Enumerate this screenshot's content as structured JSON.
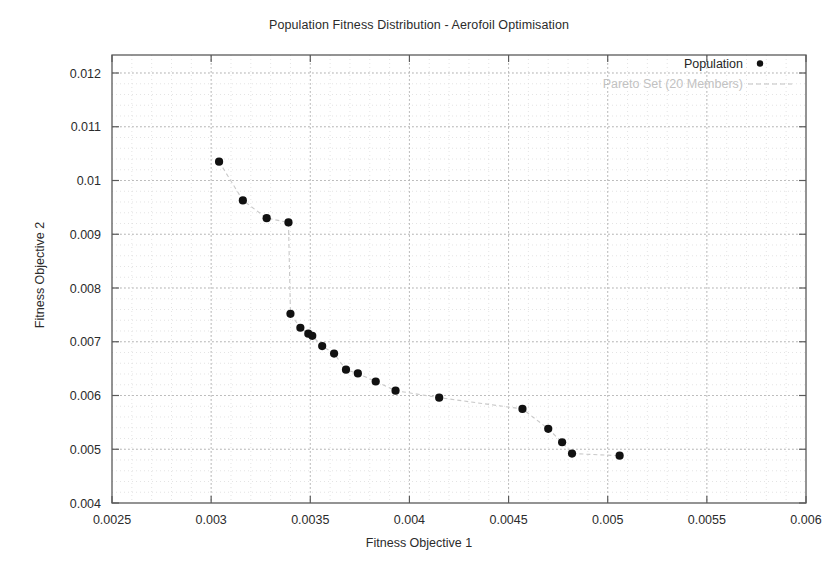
{
  "chart_data": {
    "type": "scatter",
    "title": "Population Fitness Distribution - Aerofoil Optimisation",
    "xlabel": "Fitness Objective 1",
    "ylabel": "Fitness Objective 2",
    "xlim": [
      0.0025,
      0.006
    ],
    "ylim": [
      0.004,
      0.012
    ],
    "xticks": [
      0.0025,
      0.003,
      0.0035,
      0.004,
      0.0045,
      0.005,
      0.0055,
      0.006
    ],
    "yticks": [
      0.004,
      0.005,
      0.006,
      0.007,
      0.008,
      0.009,
      0.01,
      0.011,
      0.012
    ],
    "xtick_labels": [
      "0.0025",
      "0.003",
      "0.0035",
      "0.004",
      "0.0045",
      "0.005",
      "0.0055",
      "0.006"
    ],
    "ytick_labels": [
      "0.004",
      "0.005",
      "0.006",
      "0.007",
      "0.008",
      "0.009",
      "0.01",
      "0.011",
      "0.012"
    ],
    "grid": true,
    "grid_style": "dotted",
    "legend_position": "top-right",
    "marker_color": "#111111",
    "line_color": "#c9c9c9",
    "series": [
      {
        "name": "Population",
        "marker": "filled-circle",
        "color": "#111111",
        "x": [
          0.00304,
          0.00316,
          0.00328,
          0.00339,
          0.0034,
          0.00345,
          0.00349,
          0.00351,
          0.00356,
          0.00362,
          0.00368,
          0.00374,
          0.00383,
          0.00393,
          0.00415,
          0.00457,
          0.0047,
          0.00477,
          0.00482,
          0.00506
        ],
        "y": [
          0.01035,
          0.00963,
          0.0093,
          0.00922,
          0.00752,
          0.00726,
          0.00715,
          0.00711,
          0.00692,
          0.00678,
          0.00648,
          0.00641,
          0.00626,
          0.00609,
          0.00596,
          0.00575,
          0.00538,
          0.00513,
          0.00492,
          0.00488
        ]
      },
      {
        "name": "Pareto Set (20 Members)",
        "marker": "none",
        "line_style": "dashed",
        "color": "#c9c9c9",
        "member_count": 20
      }
    ],
    "legend": [
      {
        "label": "Population",
        "swatch": "dot",
        "color": "#111111"
      },
      {
        "label": "Pareto Set (20 Members)",
        "swatch": "dashed-line",
        "color": "#c2c2c2"
      }
    ]
  },
  "plot_geometry": {
    "left": 112,
    "right": 806,
    "top": 73,
    "bottom": 503
  }
}
